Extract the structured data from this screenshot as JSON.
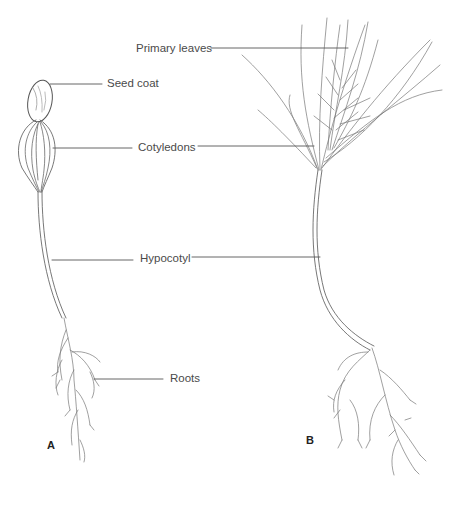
{
  "figure": {
    "panels": [
      {
        "id": "A",
        "label": "A",
        "description": "Pine seedling with seed coat still attached to cotyledons"
      },
      {
        "id": "B",
        "label": "B",
        "description": "Older pine seedling with primary leaves emerging"
      }
    ],
    "labels": {
      "primary_leaves": "Primary leaves",
      "seed_coat": "Seed coat",
      "cotyledons": "Cotyledons",
      "hypocotyl": "Hypocotyl",
      "roots": "Roots"
    },
    "colors": {
      "line": "#555555",
      "drawing": "#6a6a6a",
      "text": "#4a4a4a",
      "background": "#ffffff"
    }
  }
}
